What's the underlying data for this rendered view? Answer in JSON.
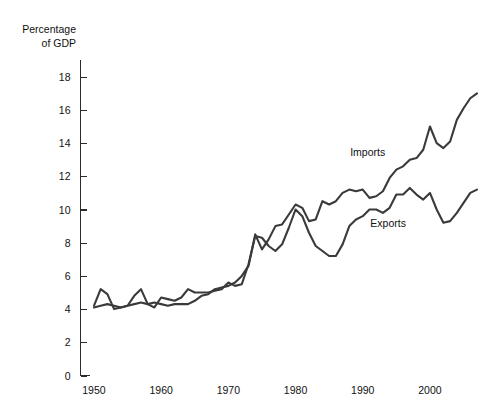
{
  "chart_data": {
    "type": "line",
    "title": "",
    "subtitle": "",
    "xlabel": "",
    "ylabel": "Percentage\nof GDP",
    "ylabel_lines": [
      "Percentage",
      "of GDP"
    ],
    "xlim": [
      1948,
      2007
    ],
    "ylim": [
      0,
      19
    ],
    "yticks": [
      0,
      2,
      4,
      6,
      8,
      10,
      12,
      14,
      16,
      18
    ],
    "ytick_labels": [
      "0",
      "2",
      "4",
      "6",
      "8",
      "10",
      "12",
      "14",
      "16",
      "18"
    ],
    "xticks": [
      1950,
      1960,
      1970,
      1980,
      1990,
      2000
    ],
    "xtick_labels": [
      "1950",
      "1960",
      "1970",
      "1980",
      "1990",
      "2000"
    ],
    "grid": false,
    "legend_position": "inline-annotation",
    "line_color": "#3a3a3a",
    "annotations": [
      {
        "text": "Imports",
        "x": 1992,
        "y": 13.4
      },
      {
        "text": "Exports",
        "x": 1995,
        "y": 9.1
      }
    ],
    "x": [
      1950,
      1951,
      1952,
      1953,
      1954,
      1955,
      1956,
      1957,
      1958,
      1959,
      1960,
      1961,
      1962,
      1963,
      1964,
      1965,
      1966,
      1967,
      1968,
      1969,
      1970,
      1971,
      1972,
      1973,
      1974,
      1975,
      1976,
      1977,
      1978,
      1979,
      1980,
      1981,
      1982,
      1983,
      1984,
      1985,
      1986,
      1987,
      1988,
      1989,
      1990,
      1991,
      1992,
      1993,
      1994,
      1995,
      1996,
      1997,
      1998,
      1999,
      2000,
      2001,
      2002,
      2003,
      2004,
      2005,
      2006,
      2007
    ],
    "series": [
      {
        "name": "Imports",
        "values": [
          4.1,
          4.2,
          4.3,
          4.2,
          4.1,
          4.2,
          4.3,
          4.4,
          4.3,
          4.4,
          4.3,
          4.2,
          4.3,
          4.3,
          4.3,
          4.5,
          4.8,
          4.9,
          5.2,
          5.3,
          5.4,
          5.6,
          6.0,
          6.6,
          8.5,
          7.6,
          8.2,
          9.0,
          9.1,
          9.7,
          10.3,
          10.1,
          9.3,
          9.4,
          10.5,
          10.3,
          10.5,
          11.0,
          11.2,
          11.1,
          11.2,
          10.7,
          10.8,
          11.1,
          11.9,
          12.4,
          12.6,
          13.0,
          13.1,
          13.6,
          15.0,
          14.0,
          13.7,
          14.1,
          15.4,
          16.1,
          16.7,
          17.0
        ]
      },
      {
        "name": "Exports",
        "values": [
          4.2,
          5.2,
          4.9,
          4.0,
          4.1,
          4.2,
          4.8,
          5.2,
          4.3,
          4.1,
          4.7,
          4.6,
          4.5,
          4.7,
          5.2,
          5.0,
          5.0,
          5.0,
          5.1,
          5.2,
          5.6,
          5.4,
          5.5,
          6.7,
          8.4,
          8.3,
          7.8,
          7.5,
          7.9,
          8.9,
          10.0,
          9.6,
          8.6,
          7.8,
          7.5,
          7.2,
          7.2,
          7.9,
          9.0,
          9.4,
          9.6,
          10.0,
          10.0,
          9.8,
          10.1,
          10.9,
          10.9,
          11.3,
          10.9,
          10.6,
          11.0,
          10.0,
          9.2,
          9.3,
          9.8,
          10.4,
          11.0,
          11.2
        ]
      }
    ]
  }
}
